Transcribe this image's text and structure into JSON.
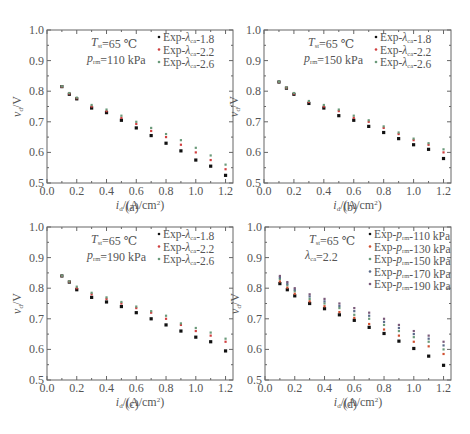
{
  "figure": {
    "common": {
      "xlabel": "i_d/(A/cm²)",
      "ylabel": "v_d/V",
      "xlim": [
        0.0,
        1.25
      ],
      "ylim": [
        0.5,
        1.0
      ],
      "xticks": [
        "0.0",
        "0.2",
        "0.4",
        "0.6",
        "0.8",
        "1.0",
        "1.2"
      ],
      "yticks": [
        "0.5",
        "0.6",
        "0.7",
        "0.8",
        "0.9",
        "1.0"
      ]
    }
  },
  "chart_data": [
    {
      "panel": "a",
      "caption": "(a)",
      "type": "scatter",
      "xlabel": "i_d/(A/cm²)",
      "ylabel": "v_d/V",
      "xlim": [
        0.0,
        1.25
      ],
      "ylim": [
        0.5,
        1.0
      ],
      "annotation": [
        "T_st=65 ℃",
        "p_rm=110 kPa"
      ],
      "legend_position": "upper right",
      "x": [
        0.1,
        0.15,
        0.2,
        0.3,
        0.4,
        0.5,
        0.6,
        0.7,
        0.8,
        0.9,
        1.0,
        1.1,
        1.2
      ],
      "series": [
        {
          "name": "Exp-λca-1.8",
          "color": "#111111",
          "values": [
            0.815,
            0.79,
            0.775,
            0.745,
            0.73,
            0.705,
            0.68,
            0.655,
            0.63,
            0.605,
            0.575,
            0.555,
            0.525
          ]
        },
        {
          "name": "Exp-λca-2.2",
          "color": "#d04040",
          "values": [
            0.815,
            0.792,
            0.777,
            0.75,
            0.735,
            0.713,
            0.693,
            0.67,
            0.65,
            0.625,
            0.6,
            0.575,
            0.545
          ]
        },
        {
          "name": "Exp-λca-2.6",
          "color": "#6a9a7a",
          "values": [
            0.816,
            0.794,
            0.779,
            0.755,
            0.74,
            0.72,
            0.7,
            0.68,
            0.66,
            0.64,
            0.615,
            0.59,
            0.56
          ]
        }
      ]
    },
    {
      "panel": "b",
      "caption": "(b)",
      "type": "scatter",
      "xlabel": "i_d/(A/cm²)",
      "ylabel": "v_d/V",
      "xlim": [
        0.0,
        1.25
      ],
      "ylim": [
        0.5,
        1.0
      ],
      "annotation": [
        "T_st=65 ℃",
        "p_rm=150 kPa"
      ],
      "legend_position": "upper right",
      "x": [
        0.1,
        0.15,
        0.2,
        0.3,
        0.4,
        0.5,
        0.6,
        0.7,
        0.8,
        0.9,
        1.0,
        1.1,
        1.2
      ],
      "series": [
        {
          "name": "Exp-λca-1.8",
          "color": "#111111",
          "values": [
            0.83,
            0.81,
            0.79,
            0.76,
            0.745,
            0.72,
            0.705,
            0.685,
            0.665,
            0.645,
            0.625,
            0.61,
            0.58
          ]
        },
        {
          "name": "Exp-λca-2.2",
          "color": "#d04040",
          "values": [
            0.83,
            0.811,
            0.792,
            0.765,
            0.75,
            0.735,
            0.713,
            0.7,
            0.68,
            0.66,
            0.64,
            0.625,
            0.6
          ]
        },
        {
          "name": "Exp-λca-2.6",
          "color": "#6a9a7a",
          "values": [
            0.831,
            0.812,
            0.794,
            0.768,
            0.755,
            0.74,
            0.72,
            0.705,
            0.685,
            0.665,
            0.645,
            0.63,
            0.61
          ]
        }
      ]
    },
    {
      "panel": "c",
      "caption": "(c)",
      "type": "scatter",
      "xlabel": "i_d/(A/cm²)",
      "ylabel": "v_d/V",
      "xlim": [
        0.0,
        1.25
      ],
      "ylim": [
        0.5,
        1.0
      ],
      "annotation": [
        "T_st=65 ℃",
        "p_rm=190 kPa"
      ],
      "legend_position": "upper right",
      "x": [
        0.1,
        0.15,
        0.2,
        0.3,
        0.4,
        0.5,
        0.6,
        0.7,
        0.8,
        0.9,
        1.0,
        1.1,
        1.2
      ],
      "series": [
        {
          "name": "Exp-λca-1.8",
          "color": "#111111",
          "values": [
            0.84,
            0.82,
            0.795,
            0.77,
            0.755,
            0.74,
            0.72,
            0.7,
            0.68,
            0.66,
            0.64,
            0.625,
            0.595
          ]
        },
        {
          "name": "Exp-λca-2.2",
          "color": "#d04040",
          "values": [
            0.84,
            0.821,
            0.8,
            0.78,
            0.765,
            0.75,
            0.735,
            0.72,
            0.7,
            0.68,
            0.66,
            0.645,
            0.625
          ]
        },
        {
          "name": "Exp-λca-2.6",
          "color": "#6a9a7a",
          "values": [
            0.841,
            0.822,
            0.805,
            0.785,
            0.77,
            0.755,
            0.74,
            0.725,
            0.71,
            0.685,
            0.67,
            0.655,
            0.635
          ]
        }
      ]
    },
    {
      "panel": "d",
      "caption": "(d)",
      "type": "scatter",
      "xlabel": "i_d/(A/cm²)",
      "ylabel": "v_d/V",
      "xlim": [
        0.0,
        1.25
      ],
      "ylim": [
        0.5,
        1.0
      ],
      "annotation": [
        "T_st=65 ℃",
        "λca=2.2"
      ],
      "legend_position": "upper right",
      "x": [
        0.1,
        0.15,
        0.2,
        0.3,
        0.4,
        0.5,
        0.6,
        0.7,
        0.8,
        0.9,
        1.0,
        1.1,
        1.2
      ],
      "series": [
        {
          "name": "Exp-p_rm-110 kPa",
          "color": "#111111",
          "values": [
            0.815,
            0.795,
            0.775,
            0.75,
            0.733,
            0.713,
            0.695,
            0.672,
            0.652,
            0.627,
            0.603,
            0.578,
            0.548
          ]
        },
        {
          "name": "Exp-p_rm-130 kPa",
          "color": "#d05030",
          "values": [
            0.822,
            0.802,
            0.782,
            0.757,
            0.741,
            0.722,
            0.703,
            0.683,
            0.665,
            0.645,
            0.625,
            0.61,
            0.585
          ]
        },
        {
          "name": "Exp-p_rm-150 kPa",
          "color": "#6a9a7a",
          "values": [
            0.83,
            0.81,
            0.79,
            0.765,
            0.75,
            0.735,
            0.713,
            0.7,
            0.68,
            0.66,
            0.64,
            0.625,
            0.6
          ]
        },
        {
          "name": "Exp-p_rm-170 kPa",
          "color": "#5a6a8a",
          "values": [
            0.835,
            0.815,
            0.795,
            0.773,
            0.757,
            0.742,
            0.725,
            0.71,
            0.69,
            0.67,
            0.65,
            0.635,
            0.613
          ]
        },
        {
          "name": "Exp-p_rm-190 kPa",
          "color": "#7a5a7a",
          "values": [
            0.84,
            0.82,
            0.8,
            0.78,
            0.765,
            0.75,
            0.735,
            0.72,
            0.7,
            0.68,
            0.66,
            0.645,
            0.625
          ]
        }
      ]
    }
  ]
}
